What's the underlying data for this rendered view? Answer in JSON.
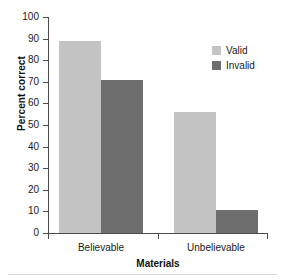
{
  "chart_data": {
    "type": "bar",
    "title": "",
    "xlabel": "Materials",
    "ylabel": "Percent correct",
    "categories": [
      "Believable",
      "Unbelievable"
    ],
    "series": [
      {
        "name": "Valid",
        "values": [
          89,
          56
        ],
        "color": "#c3c3c3"
      },
      {
        "name": "Invalid",
        "values": [
          71,
          10.5
        ],
        "color": "#6e6e6e"
      }
    ],
    "ylim": [
      0,
      100
    ],
    "ytick_step": 10,
    "yticks": [
      0,
      10,
      20,
      30,
      40,
      50,
      60,
      70,
      80,
      90,
      100
    ],
    "ytick_labels": [
      "0",
      "10",
      "20",
      "30",
      "40",
      "50",
      "60",
      "70",
      "80",
      "90",
      "100"
    ],
    "grid": false,
    "legend_position": "top-right",
    "legend_entries": [
      "Valid",
      "Invalid"
    ]
  },
  "axes": {
    "y_title": "Percent correct",
    "x_title": "Materials"
  },
  "colors": {
    "valid": "#c3c3c3",
    "invalid": "#6e6e6e",
    "axis": "#4a4a4a",
    "text": "#1a1a1a",
    "background": "#ffffff"
  }
}
